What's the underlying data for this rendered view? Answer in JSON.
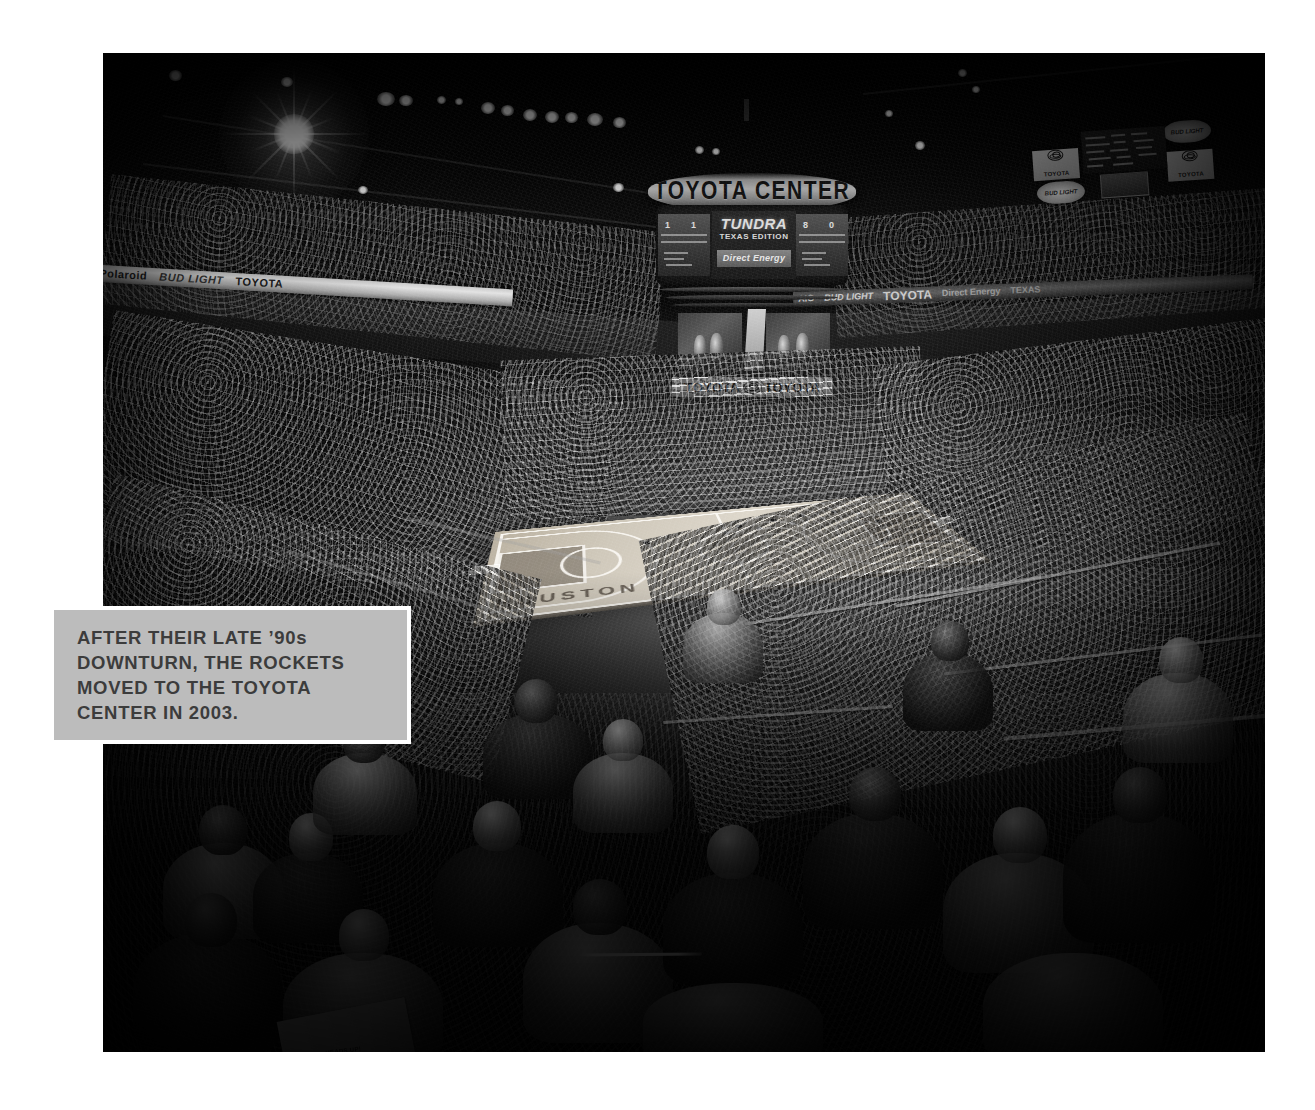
{
  "page": {
    "background_color": "#ffffff",
    "width": 1315,
    "height": 1110
  },
  "photo": {
    "subject": "Interior of Toyota Center arena during a Houston Rockets basketball game, viewed from upper-level seating behind the crowd",
    "treatment": "black-and-white",
    "frame": {
      "left": 103,
      "top": 53,
      "width": 1162,
      "height": 999
    }
  },
  "caption": {
    "text": "AFTER THEIR LATE ’90s\nDOWNTURN, THE ROCKETS\nMOVED TO THE TOYOTA\nCENTER IN 2003.",
    "background_color": "#bcbcbc",
    "border_color": "#ffffff",
    "text_color": "#3c3c3c"
  },
  "scoreboard": {
    "ring_text": "TOYOTA CENTER",
    "main_ad_line1": "TUNDRA",
    "main_ad_line2": "TEXAS EDITION",
    "sponsor_bar": "Direct Energy",
    "lower_banner_left": "TOYOTA",
    "lower_banner_right": "TOYOTA",
    "stat_numbers": [
      "1",
      "1",
      "8",
      "0"
    ]
  },
  "aux_board": {
    "logo_left": "TOYOTA",
    "logo_right": "TOYOTA",
    "ad_top": "BUD LIGHT",
    "ad_bottom": "BUD LIGHT"
  },
  "ribbon_signage": {
    "left_band": [
      "Polaroid",
      "BUD LIGHT",
      "TOYOTA"
    ],
    "right_band": [
      "AIG",
      "BUD LIGHT",
      "TOYOTA",
      "Direct Energy",
      "TEXAS"
    ]
  },
  "court": {
    "baseline_word": "HOUSTON",
    "surface_color": "#cfc8ba",
    "paint_color": "#766e63",
    "line_color": "#fcfaf5"
  },
  "crowd": {
    "program_text": "HEADS UP!"
  },
  "lighting": {
    "flare_position": {
      "x": 255,
      "y": 80
    },
    "ceiling_light_count": 14
  }
}
